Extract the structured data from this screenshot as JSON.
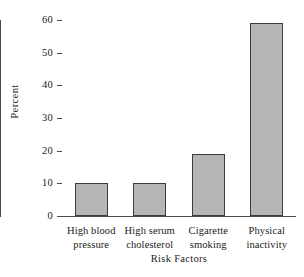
{
  "chart_data": {
    "type": "bar",
    "title": "",
    "subtitle": "",
    "xlabel": "Risk Factors",
    "ylabel": "Percent",
    "categories": [
      "High blood pressure",
      "High serum cholesterol",
      "Cigarette smoking",
      "Physical inactivity"
    ],
    "category_lines": [
      [
        "High blood",
        "pressure"
      ],
      [
        "High serum",
        "cholesterol"
      ],
      [
        "Cigarette",
        "smoking"
      ],
      [
        "Physical",
        "inactivity"
      ]
    ],
    "values": [
      10,
      10,
      19,
      59
    ],
    "ylim": [
      0,
      60
    ],
    "yticks": [
      0,
      10,
      20,
      30,
      40,
      50,
      60
    ],
    "ytick_labels": [
      "0",
      "10",
      "20",
      "30",
      "40",
      "50",
      "60"
    ],
    "grid": false,
    "legend": null,
    "bar_fill_color": "#b6b6b6",
    "bar_edge_color": "#3c3c3c",
    "axis_color": "#4d4d4d"
  },
  "axes": {
    "ylabel": "Percent",
    "xlabel": "Risk Factors"
  },
  "ticks": {
    "y": [
      "60",
      "50",
      "40",
      "30",
      "20",
      "10",
      "0"
    ]
  },
  "categories": {
    "c0_l1": "High blood",
    "c0_l2": "pressure",
    "c1_l1": "High serum",
    "c1_l2": "cholesterol",
    "c2_l1": "Cigarette",
    "c2_l2": "smoking",
    "c3_l1": "Physical",
    "c3_l2": "inactivity"
  }
}
